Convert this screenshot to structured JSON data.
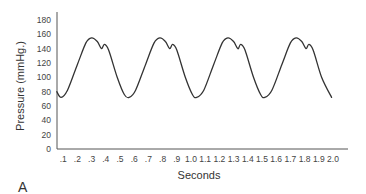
{
  "chart_data": {
    "type": "line",
    "title": "",
    "panel_label": "A",
    "xlabel": "Seconds",
    "ylabel": "Pressure (mmHg.)",
    "xlim": [
      0,
      2.05
    ],
    "ylim": [
      0,
      180
    ],
    "grid": false,
    "legend": null,
    "x_ticks": [
      ".1",
      ".2",
      ".3",
      ".4",
      ".5",
      ".6",
      ".7",
      ".8",
      ".9",
      "1.0",
      "1.1",
      "1.2",
      "1.3",
      "1.4",
      "1.5",
      "1.6",
      "1.7",
      "1.8",
      "1.9",
      "2.0"
    ],
    "x_tick_values": [
      0.1,
      0.2,
      0.3,
      0.4,
      0.5,
      0.6,
      0.7,
      0.8,
      0.9,
      1.0,
      1.1,
      1.2,
      1.3,
      1.4,
      1.5,
      1.6,
      1.7,
      1.8,
      1.9,
      2.0
    ],
    "y_ticks": [
      "0",
      "20",
      "40",
      "60",
      "80",
      "100",
      "120",
      "140",
      "160",
      "180"
    ],
    "y_tick_values": [
      0,
      20,
      40,
      60,
      80,
      100,
      120,
      140,
      160,
      180
    ],
    "series": [
      {
        "name": "Arterial pressure waveform",
        "color": "#333333",
        "x": [
          0.055,
          0.085,
          0.13,
          0.2,
          0.26,
          0.3,
          0.34,
          0.37,
          0.39,
          0.42,
          0.48,
          0.53,
          0.565,
          0.61,
          0.68,
          0.74,
          0.78,
          0.82,
          0.85,
          0.87,
          0.9,
          0.96,
          1.01,
          1.04,
          1.09,
          1.16,
          1.22,
          1.26,
          1.3,
          1.33,
          1.35,
          1.38,
          1.44,
          1.49,
          1.52,
          1.57,
          1.64,
          1.7,
          1.74,
          1.78,
          1.81,
          1.83,
          1.86,
          1.92,
          1.99
        ],
        "y": [
          80,
          72,
          82,
          118,
          148,
          155,
          150,
          140,
          146,
          138,
          100,
          76,
          72,
          82,
          118,
          148,
          155,
          150,
          140,
          146,
          138,
          100,
          76,
          72,
          82,
          118,
          148,
          155,
          150,
          140,
          146,
          138,
          100,
          76,
          72,
          82,
          118,
          148,
          155,
          150,
          140,
          146,
          138,
          100,
          72
        ]
      }
    ],
    "annotations": []
  }
}
